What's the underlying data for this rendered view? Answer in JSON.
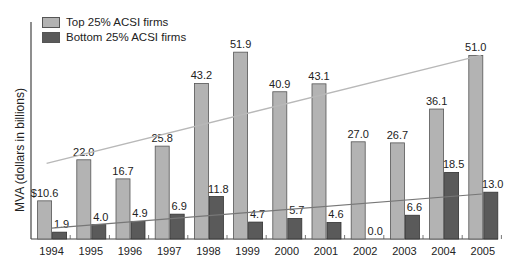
{
  "chart_data": {
    "type": "bar",
    "title": "",
    "xlabel": "",
    "ylabel": "MVA (dollars in billions)",
    "categories": [
      "1994",
      "1995",
      "1996",
      "1997",
      "1998",
      "1999",
      "2000",
      "2001",
      "2002",
      "2003",
      "2004",
      "2005"
    ],
    "series": [
      {
        "name": "Top 25% ACSI firms",
        "color": "#b3b3b3",
        "values": [
          10.6,
          22.0,
          16.7,
          25.8,
          43.2,
          51.9,
          40.9,
          43.1,
          27.0,
          26.7,
          36.1,
          51.0
        ],
        "labels": [
          "$10.6",
          "22.0",
          "16.7",
          "25.8",
          "43.2",
          "51.9",
          "40.9",
          "43.1",
          "27.0",
          "26.7",
          "36.1",
          "51.0"
        ],
        "trendline": {
          "start": 21.0,
          "end": 51.0,
          "color": "#b8b8b8"
        }
      },
      {
        "name": "Bottom 25% ACSI firms",
        "color": "#5a5a5a",
        "values": [
          1.9,
          4.0,
          4.9,
          6.9,
          11.8,
          4.7,
          5.7,
          4.6,
          0.0,
          6.6,
          18.5,
          13.0
        ],
        "labels": [
          "1.9",
          "4.0",
          "4.9",
          "6.9",
          "11.8",
          "4.7",
          "5.7",
          "4.6",
          "0.0",
          "6.6",
          "18.5",
          "13.0"
        ],
        "trendline": {
          "start": 3.0,
          "end": 12.5,
          "color": "#777777"
        }
      }
    ],
    "ylim": [
      0,
      55
    ],
    "grid": false,
    "legend_position": "top-left"
  }
}
